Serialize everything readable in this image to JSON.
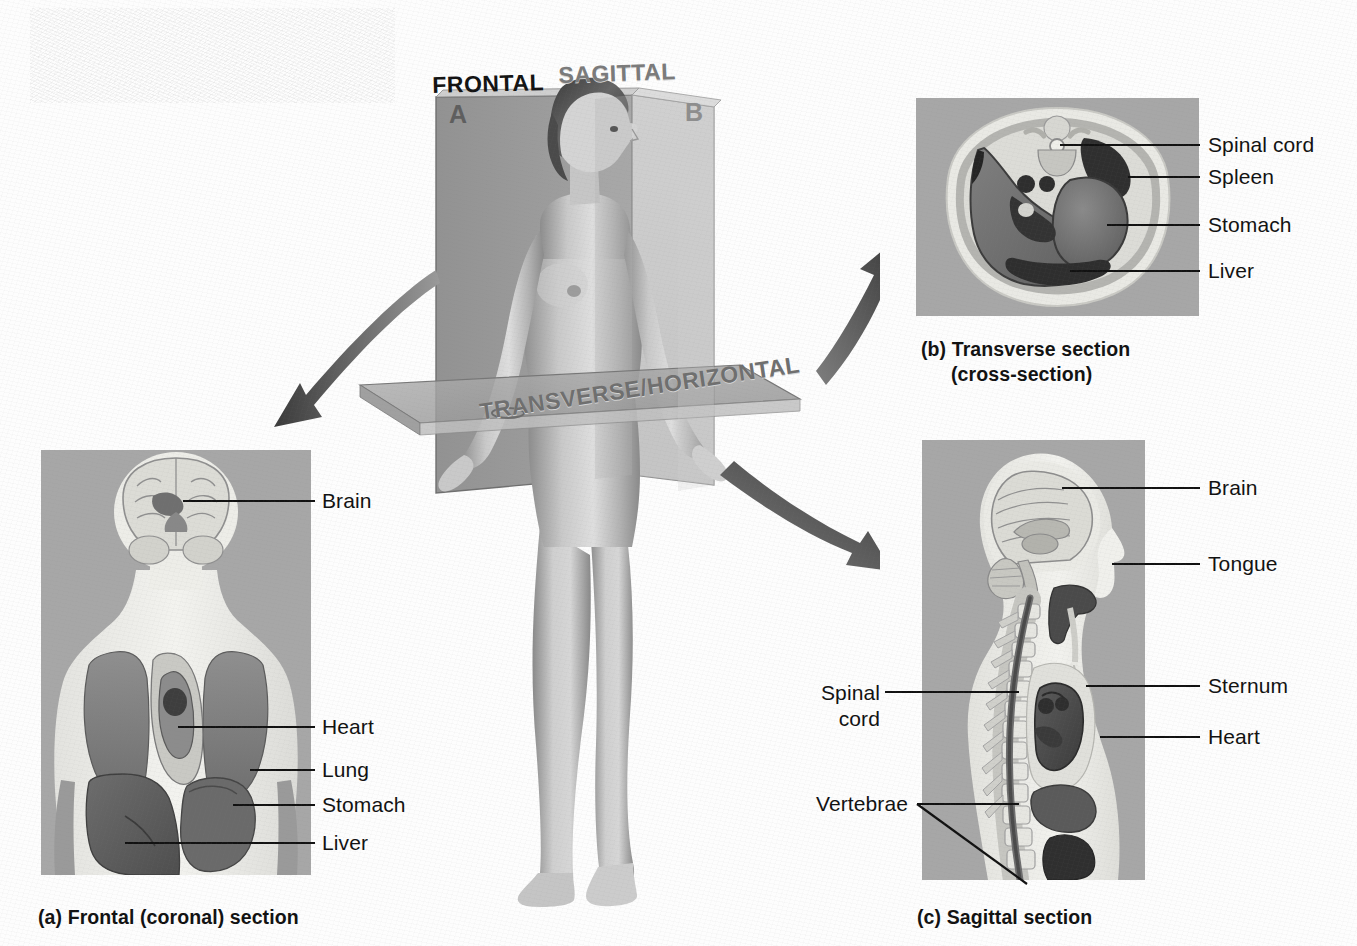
{
  "figure": {
    "plane_labels": [
      {
        "id": "frontal",
        "text": "FRONTAL"
      },
      {
        "id": "sagittal",
        "text": "SAGITTAL"
      },
      {
        "id": "transverse",
        "text": "TRANSVERSE/HORIZONTAL"
      }
    ],
    "plane_letters": [
      {
        "id": "a",
        "text": "A"
      },
      {
        "id": "b",
        "text": "B"
      }
    ]
  },
  "panel_a": {
    "caption": "(a) Frontal (coronal) section",
    "labels": [
      {
        "id": "brain",
        "text": "Brain"
      },
      {
        "id": "heart",
        "text": "Heart"
      },
      {
        "id": "lung",
        "text": "Lung"
      },
      {
        "id": "stomach",
        "text": "Stomach"
      },
      {
        "id": "liver",
        "text": "Liver"
      }
    ]
  },
  "panel_b": {
    "caption_line1": "(b) Transverse section",
    "caption_line2": "(cross-section)",
    "labels": [
      {
        "id": "spinal-cord",
        "text": "Spinal cord"
      },
      {
        "id": "spleen",
        "text": "Spleen"
      },
      {
        "id": "stomach",
        "text": "Stomach"
      },
      {
        "id": "liver",
        "text": "Liver"
      }
    ]
  },
  "panel_c": {
    "caption": "(c) Sagittal section",
    "labels_right": [
      {
        "id": "brain",
        "text": "Brain"
      },
      {
        "id": "tongue",
        "text": "Tongue"
      },
      {
        "id": "sternum",
        "text": "Sternum"
      },
      {
        "id": "heart",
        "text": "Heart"
      }
    ],
    "labels_left": [
      {
        "id": "spinal-cord-line1",
        "text": "Spinal"
      },
      {
        "id": "spinal-cord-line2",
        "text": "cord"
      },
      {
        "id": "vertebrae",
        "text": "Vertebrae"
      }
    ]
  },
  "colors": {
    "panel_background": "#a7a7a7",
    "body_fill": "#f0f0ec",
    "organ_dark": "#6a6a6a",
    "organ_mid": "#8d8d8d",
    "organ_light": "#c4c4c4",
    "leader_line": "#111111",
    "frontal_plane": "#8e8e8e",
    "sagittal_plane": "#b5b5b5",
    "transverse_plane": "#9d9d9d"
  }
}
